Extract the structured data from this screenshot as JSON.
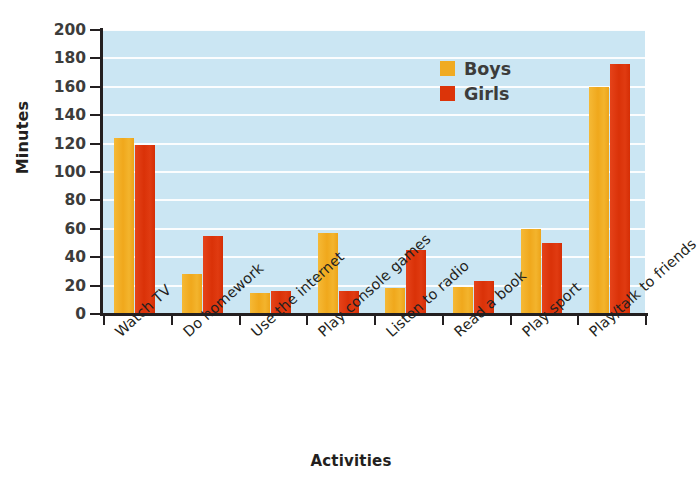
{
  "chart_data": {
    "type": "bar",
    "title": "",
    "subtitle": "",
    "xlabel": "Activities",
    "ylabel": "Minutes",
    "ylim": [
      0,
      200
    ],
    "ytick_step": 20,
    "yticks": [
      200,
      180,
      160,
      140,
      120,
      100,
      80,
      60,
      40,
      20,
      0
    ],
    "grid": true,
    "grid_axis": "y",
    "legend_position": "top-right",
    "categories": [
      "Watch TV",
      "Do homework",
      "Use the internet",
      "Play console games",
      "Listen to radio",
      "Read a book",
      "Play sport",
      "Play/talk to friends"
    ],
    "series": [
      {
        "name": "Boys",
        "color": "#f0ab22",
        "values": [
          124,
          28,
          15,
          57,
          18,
          19,
          60,
          160
        ]
      },
      {
        "name": "Girls",
        "color": "#dc3409",
        "values": [
          119,
          55,
          16,
          16,
          45,
          23,
          50,
          176
        ]
      }
    ],
    "plot_background": "#cbe6f3",
    "gridline_color": "#ffffff",
    "axis_color": "#231f20"
  },
  "legend": {
    "items": [
      {
        "label": "Boys"
      },
      {
        "label": "Girls"
      }
    ]
  }
}
